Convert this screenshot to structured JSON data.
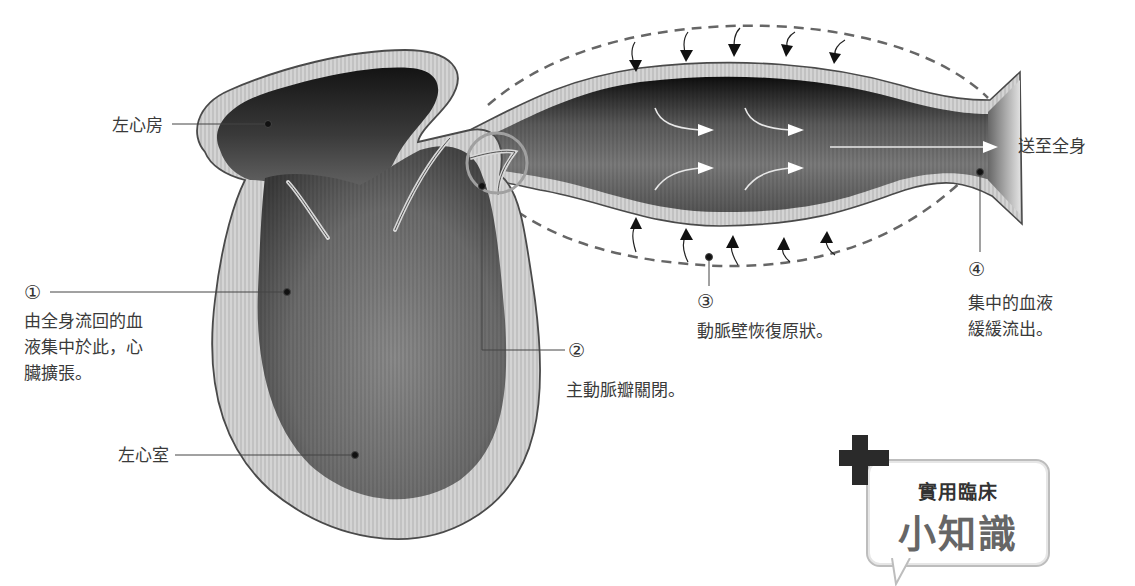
{
  "diagram": {
    "type": "anatomy-illustration"
  },
  "labels": {
    "left_atrium": "左心房",
    "left_ventricle": "左心室",
    "to_body": "送至全身"
  },
  "steps": [
    {
      "number": "①",
      "text": "由全身流回的血\n液集中於此，心\n臟擴張。"
    },
    {
      "number": "②",
      "text": "主動脈瓣關閉。"
    },
    {
      "number": "③",
      "text": "動脈壁恢復原狀。"
    },
    {
      "number": "④",
      "text": "集中的血液\n緩緩流出。"
    }
  ],
  "callout": {
    "small": "實用臨床",
    "big": "小知識",
    "icon": "plus-cross-icon"
  },
  "colors": {
    "wall": "#d2d2d2",
    "wall_outline": "#4a4a4a",
    "chamber_dark": "#1e1e1e",
    "chamber_mid": "#6a6a6a",
    "dashed": "#666666",
    "valve_ring": "#a0a0a0"
  }
}
